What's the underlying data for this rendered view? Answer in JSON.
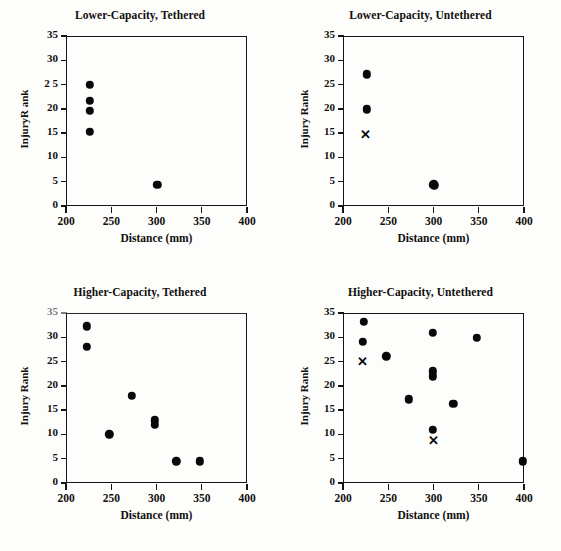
{
  "figure": {
    "shared_xlabel": "Distance (mm)",
    "shared_ylabel": "Injury Rank",
    "marker_colors": {
      "circle": "#090909",
      "cross": "#0b0b0b",
      "axis": "#151515"
    },
    "background": "#fdfdfb"
  },
  "panels": [
    {
      "id": "lower-capacity-tethered",
      "title": "Lower-Capacity,  Tethered",
      "ylabel": "InjuryR ank",
      "xlabel": "Distance (mm)",
      "xticks": [
        "200",
        "250",
        "300",
        "350",
        "400"
      ],
      "yticks": [
        "0",
        "5",
        "10",
        "15",
        "20",
        "2 5",
        "30",
        "35"
      ]
    },
    {
      "id": "lower-capacity-untethered",
      "title": "Lower-Capacity,  Untethered",
      "ylabel": "Injury Rank",
      "xlabel": "Distance (mm)",
      "xticks": [
        "200",
        "250",
        "300",
        "350",
        "400"
      ],
      "yticks": [
        "0",
        "5",
        "10",
        "15",
        "20",
        "25",
        "30",
        "35"
      ]
    },
    {
      "id": "higher-capacity-tethered",
      "title": "Higher-Capacity,  Tethered",
      "ylabel": "Injury Rank",
      "xlabel": "Distance (mm)",
      "xticks": [
        "200",
        "250",
        "300",
        "350",
        "400"
      ],
      "yticks": [
        "0",
        "5",
        "10",
        "15",
        "20",
        "25",
        "30",
        "35"
      ]
    },
    {
      "id": "higher-capacity-untethered",
      "title": "Higher-Capacity, Untethered",
      "ylabel": "Injury Rank",
      "xlabel": "Distance (mm)",
      "xticks": [
        "200",
        "250",
        "300",
        "350",
        "400"
      ],
      "yticks": [
        "0",
        "5",
        "10",
        "15",
        "20",
        "25",
        "30",
        "35"
      ]
    }
  ],
  "chart_data": [
    {
      "type": "scatter",
      "title": "Lower-Capacity,  Tethered",
      "xlabel": "Distance (mm)",
      "ylabel": "InjuryR ank",
      "xlim": [
        200,
        400
      ],
      "ylim": [
        0,
        35
      ],
      "xticks": [
        200,
        250,
        300,
        350,
        400
      ],
      "yticks": [
        0,
        5,
        10,
        15,
        20,
        25,
        30,
        35
      ],
      "grid": false,
      "legend": "none",
      "series": [
        {
          "name": "circle",
          "marker": "filled-circle",
          "points": [
            {
              "x": 226,
              "y": 25.0
            },
            {
              "x": 226,
              "y": 21.6
            },
            {
              "x": 226,
              "y": 19.6
            },
            {
              "x": 226,
              "y": 15.3
            },
            {
              "x": 301,
              "y": 4.4
            }
          ]
        }
      ]
    },
    {
      "type": "scatter",
      "title": "Lower-Capacity,  Untethered",
      "xlabel": "Distance (mm)",
      "ylabel": "Injury Rank",
      "xlim": [
        200,
        400
      ],
      "ylim": [
        0,
        35
      ],
      "xticks": [
        200,
        250,
        300,
        350,
        400
      ],
      "yticks": [
        0,
        5,
        10,
        15,
        20,
        25,
        30,
        35
      ],
      "grid": false,
      "legend": "none",
      "series": [
        {
          "name": "circle",
          "marker": "filled-circle",
          "points": [
            {
              "x": 226,
              "y": 27.1
            },
            {
              "x": 226,
              "y": 19.9
            },
            {
              "x": 300,
              "y": 4.6
            },
            {
              "x": 301,
              "y": 4.3
            },
            {
              "x": 299,
              "y": 4.4
            }
          ]
        },
        {
          "name": "cross",
          "marker": "x",
          "points": [
            {
              "x": 225,
              "y": 14.8
            }
          ]
        }
      ]
    },
    {
      "type": "scatter",
      "title": "Higher-Capacity,  Tethered",
      "xlabel": "Distance (mm)",
      "ylabel": "Injury Rank",
      "xlim": [
        200,
        400
      ],
      "ylim": [
        0,
        35
      ],
      "xticks": [
        200,
        250,
        300,
        350,
        400
      ],
      "yticks": [
        0,
        5,
        10,
        15,
        20,
        25,
        30,
        35
      ],
      "grid": false,
      "legend": "none",
      "series": [
        {
          "name": "circle",
          "marker": "filled-circle",
          "points": [
            {
              "x": 223,
              "y": 32.3
            },
            {
              "x": 223,
              "y": 28.1
            },
            {
              "x": 248,
              "y": 10.0
            },
            {
              "x": 273,
              "y": 18.0
            },
            {
              "x": 298,
              "y": 12.9
            },
            {
              "x": 298,
              "y": 12.0
            },
            {
              "x": 322,
              "y": 4.5
            },
            {
              "x": 348,
              "y": 4.5
            }
          ]
        }
      ]
    },
    {
      "type": "scatter",
      "title": "Higher-Capacity, Untethered",
      "xlabel": "Distance (mm)",
      "ylabel": "Injury Rank",
      "xlim": [
        200,
        400
      ],
      "ylim": [
        0,
        35
      ],
      "xticks": [
        200,
        250,
        300,
        350,
        400
      ],
      "yticks": [
        0,
        5,
        10,
        15,
        20,
        25,
        30,
        35
      ],
      "grid": false,
      "legend": "none",
      "series": [
        {
          "name": "circle",
          "marker": "filled-circle",
          "points": [
            {
              "x": 223,
              "y": 33.2
            },
            {
              "x": 222,
              "y": 29.1
            },
            {
              "x": 248,
              "y": 26.1
            },
            {
              "x": 273,
              "y": 17.2
            },
            {
              "x": 299,
              "y": 30.9
            },
            {
              "x": 299,
              "y": 23.0
            },
            {
              "x": 299,
              "y": 22.0
            },
            {
              "x": 299,
              "y": 11.0
            },
            {
              "x": 322,
              "y": 16.3
            },
            {
              "x": 348,
              "y": 29.9
            },
            {
              "x": 399,
              "y": 4.5
            }
          ]
        },
        {
          "name": "cross",
          "marker": "x",
          "points": [
            {
              "x": 221,
              "y": 25.2
            },
            {
              "x": 300,
              "y": 8.8
            }
          ]
        }
      ]
    }
  ]
}
